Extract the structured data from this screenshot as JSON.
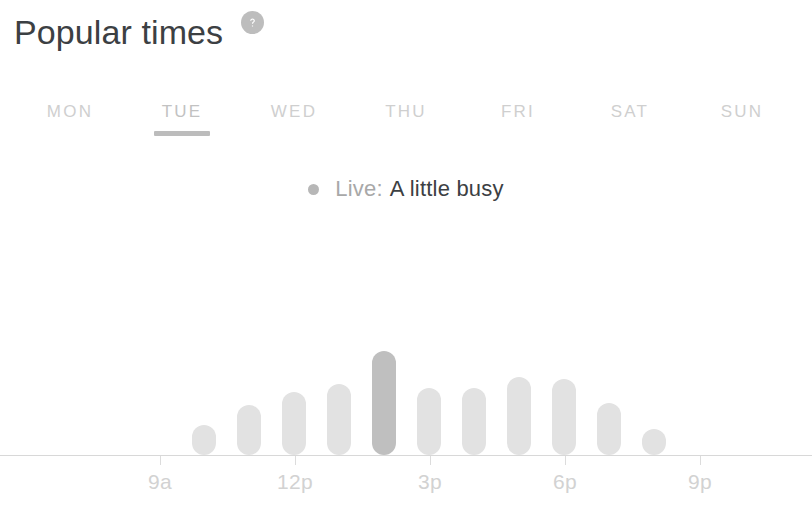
{
  "header": {
    "title": "Popular times",
    "help_icon": "help-circle-icon"
  },
  "day_tabs": {
    "active": "TUE",
    "items": [
      {
        "label": "MON"
      },
      {
        "label": "TUE"
      },
      {
        "label": "WED"
      },
      {
        "label": "THU"
      },
      {
        "label": "FRI"
      },
      {
        "label": "SAT"
      },
      {
        "label": "SUN"
      }
    ]
  },
  "live_status": {
    "dot_icon": "live-dot-icon",
    "label": "Live:",
    "value": "A little busy"
  },
  "colors": {
    "bar": "#e2e2e2",
    "bar_now": "#bfbfbf",
    "axis": "#d8d8d8",
    "tab_inactive": "#cfcfcf",
    "tab_underline": "#bcbcbc",
    "title": "#3c4043",
    "muted_text": "#a8a8a8"
  },
  "chart_data": {
    "type": "bar",
    "title": "Popular times",
    "xlabel": "",
    "ylabel": "",
    "grid": false,
    "legend": false,
    "categories": [
      "8a",
      "9a",
      "10a",
      "11a",
      "12p",
      "1p",
      "2p",
      "3p",
      "4p",
      "5p",
      "6p"
    ],
    "values": [
      28,
      46,
      58,
      66,
      96,
      62,
      62,
      72,
      70,
      48,
      24
    ],
    "ylim": [
      0,
      100
    ],
    "tick_labels": [
      "9a",
      "12p",
      "3p",
      "6p",
      "9p"
    ],
    "tick_positions": [
      160,
      295,
      430,
      565,
      700
    ],
    "highlight_index": 4,
    "highlight_note": "current time — A little busy",
    "bar_start_x": 192,
    "bar_pitch": 45,
    "bar_width": 24,
    "baseline_y": 455
  }
}
